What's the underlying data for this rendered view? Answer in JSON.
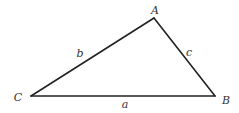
{
  "diagram": {
    "type": "triangle",
    "colors": {
      "stroke": "#222222",
      "label": "#333333",
      "background": "#ffffff"
    },
    "vertices": [
      {
        "name": "A",
        "label": "A",
        "x": 154,
        "y": 18,
        "label_x": 155,
        "label_y": 14
      },
      {
        "name": "B",
        "label": "B",
        "x": 215,
        "y": 96,
        "label_x": 226,
        "label_y": 104
      },
      {
        "name": "C",
        "label": "C",
        "x": 31,
        "y": 96,
        "label_x": 18,
        "label_y": 101
      }
    ],
    "sides": [
      {
        "name": "a",
        "label": "a",
        "from": "C",
        "to": "B",
        "label_x": 125,
        "label_y": 108
      },
      {
        "name": "b",
        "label": "b",
        "from": "C",
        "to": "A",
        "label_x": 80,
        "label_y": 57
      },
      {
        "name": "c",
        "label": "c",
        "from": "A",
        "to": "B",
        "label_x": 189,
        "label_y": 56
      }
    ]
  }
}
